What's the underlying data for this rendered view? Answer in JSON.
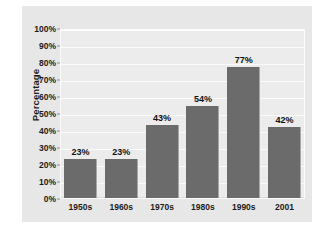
{
  "chart_data": {
    "type": "bar",
    "title": "",
    "xlabel": "",
    "ylabel": "Percentage",
    "categories": [
      "1950s",
      "1960s",
      "1970s",
      "1980s",
      "1990s",
      "2001"
    ],
    "values": [
      23,
      43,
      54,
      77,
      42,
      23
    ],
    "series": [
      {
        "name": "Percentage",
        "values": [
          23,
          23,
          43,
          54,
          77,
          42
        ]
      }
    ],
    "data_labels": [
      "23%",
      "23%",
      "43%",
      "54%",
      "77%",
      "42%"
    ],
    "ylim": [
      0,
      100
    ],
    "ytick_values": [
      0,
      10,
      20,
      30,
      40,
      50,
      60,
      70,
      80,
      90,
      100
    ],
    "ytick_labels": [
      "0%",
      "10%",
      "20%",
      "30%",
      "40%",
      "50%",
      "60%",
      "70%",
      "80%",
      "90%",
      "100%"
    ],
    "grid": true,
    "legend": false,
    "legend_position": "none",
    "colors": {
      "bar": "#6b6b6b",
      "panel_background": "#e7e7e7",
      "plot_background": "#ececec",
      "gridline": "#fbfbfb",
      "text": "#1b1b1b",
      "page_background": "#ffffff"
    }
  }
}
